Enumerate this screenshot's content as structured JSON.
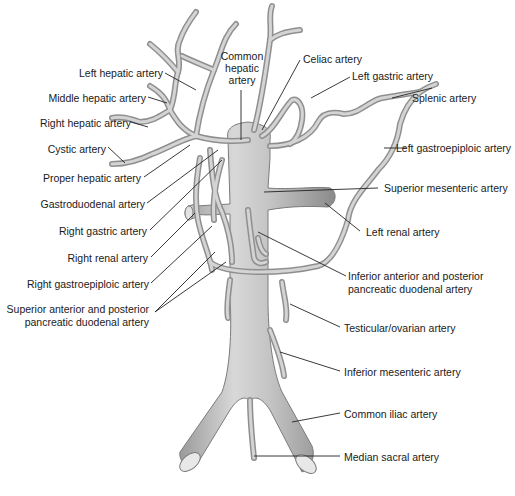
{
  "figure": {
    "type": "anatomical-illustration",
    "colors": {
      "vessel_fill": "#bdbdbd",
      "vessel_outline": "#8f8f8f",
      "highlight": "#e6e6e6",
      "label_text": "#1a1a1a",
      "leader_line": "#222222",
      "background": "#ffffff"
    }
  },
  "labels": {
    "left": [
      {
        "id": "left-hepatic",
        "text": "Left hepatic artery"
      },
      {
        "id": "middle-hepatic",
        "text": "Middle hepatic artery"
      },
      {
        "id": "right-hepatic",
        "text": "Right hepatic artery"
      },
      {
        "id": "cystic",
        "text": "Cystic artery"
      },
      {
        "id": "proper-hepatic",
        "text": "Proper hepatic artery"
      },
      {
        "id": "gastroduodenal",
        "text": "Gastroduodenal artery"
      },
      {
        "id": "right-gastric",
        "text": "Right gastric artery"
      },
      {
        "id": "right-renal",
        "text": "Right renal artery"
      },
      {
        "id": "right-gastroepiploic",
        "text": "Right gastroepiploic artery"
      },
      {
        "id": "superior-pancreatic-duodenal-1",
        "text": "Superior anterior and posterior"
      },
      {
        "id": "superior-pancreatic-duodenal-2",
        "text": "pancreatic duodenal artery"
      }
    ],
    "top": [
      {
        "id": "common-hepatic-1",
        "text": "Common"
      },
      {
        "id": "common-hepatic-2",
        "text": "hepatic"
      },
      {
        "id": "common-hepatic-3",
        "text": "artery"
      }
    ],
    "right": [
      {
        "id": "celiac",
        "text": "Celiac artery"
      },
      {
        "id": "left-gastric",
        "text": "Left gastric artery"
      },
      {
        "id": "splenic",
        "text": "Splenic artery"
      },
      {
        "id": "left-gastroepiploic",
        "text": "Left gastroepiploic artery"
      },
      {
        "id": "superior-mesenteric",
        "text": "Superior mesenteric artery"
      },
      {
        "id": "left-renal",
        "text": "Left renal artery"
      },
      {
        "id": "inferior-pancreatic-duodenal-1",
        "text": "Inferior anterior and posterior"
      },
      {
        "id": "inferior-pancreatic-duodenal-2",
        "text": "pancreatic duodenal artery"
      },
      {
        "id": "testicular-ovarian",
        "text": "Testicular/ovarian artery"
      },
      {
        "id": "inferior-mesenteric",
        "text": "Inferior mesenteric artery"
      },
      {
        "id": "common-iliac",
        "text": "Common iliac artery"
      },
      {
        "id": "median-sacral",
        "text": "Median sacral artery"
      }
    ]
  }
}
